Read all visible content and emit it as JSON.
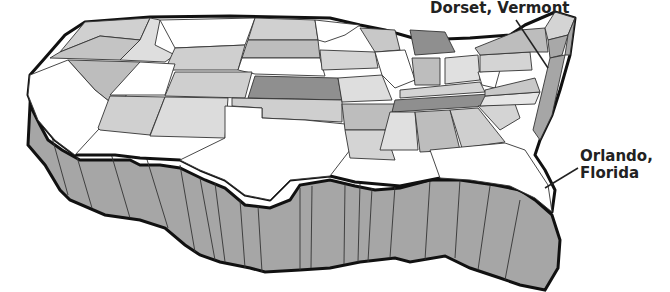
{
  "annotations": [
    {
      "id": "dorset",
      "text": "Dorset, Vermont"
    },
    {
      "id": "orlando_line1",
      "text": "Orlando,"
    },
    {
      "id": "orlando_line2",
      "text": "Florida"
    }
  ],
  "map": {
    "subject": "3D extruded map of the contiguous United States",
    "colors": {
      "white": "#ffffff",
      "light": "#d9d9d9",
      "mid": "#bdbdbd",
      "dark": "#8f8f8f",
      "wall": "#a6a6a6",
      "outline": "#222222"
    }
  }
}
